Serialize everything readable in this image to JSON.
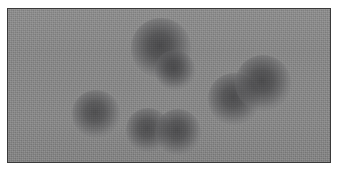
{
  "figure": {
    "kind": "grayscale-micrograph",
    "canvas": {
      "width": 341,
      "height": 170
    },
    "panel": {
      "x": 7,
      "y": 8,
      "width": 324,
      "height": 155,
      "border_color": "#3a3a3a",
      "border_width": 1,
      "margin_color": "#ffffff"
    },
    "background": {
      "color": "#878787",
      "noise": "fine-grain",
      "description": "uniform medium-gray noisy field"
    },
    "palette": {
      "field_gray": "#878787",
      "particle_core": "#565658",
      "particle_edge": "#7b7b7c",
      "frame_line": "#3a3a3a",
      "page_white": "#ffffff"
    }
  },
  "chart_data": {
    "type": "scatter",
    "title": "",
    "xlabel": "",
    "ylabel": "",
    "xlim": [
      0,
      324
    ],
    "ylim": [
      0,
      155
    ],
    "grid": false,
    "legend": null,
    "units": "pixels (panel coordinates)",
    "series": [
      {
        "name": "particles",
        "points": [
          {
            "id": "p1",
            "cluster": "left-isolated",
            "cx": 88,
            "cy": 105,
            "r": 18,
            "darkness": 0.8
          },
          {
            "id": "p2",
            "cluster": "bottom-center-pair",
            "cx": 140,
            "cy": 121,
            "r": 16,
            "darkness": 0.82
          },
          {
            "id": "p3",
            "cluster": "bottom-center-pair",
            "cx": 170,
            "cy": 123,
            "r": 17,
            "darkness": 0.84
          },
          {
            "id": "p4",
            "cluster": "top-center-doublet",
            "cx": 153,
            "cy": 39,
            "r": 22,
            "darkness": 0.88
          },
          {
            "id": "p5",
            "cluster": "top-center-doublet",
            "cx": 167,
            "cy": 61,
            "r": 15,
            "darkness": 0.82
          },
          {
            "id": "p6",
            "cluster": "right-pair",
            "cx": 226,
            "cy": 90,
            "r": 19,
            "darkness": 0.84
          },
          {
            "id": "p7",
            "cluster": "right-pair",
            "cx": 255,
            "cy": 74,
            "r": 21,
            "darkness": 0.86
          }
        ]
      }
    ],
    "counts": {
      "total_particles": 7,
      "clusters": 4,
      "singlets": 1,
      "doublets": 3
    }
  }
}
